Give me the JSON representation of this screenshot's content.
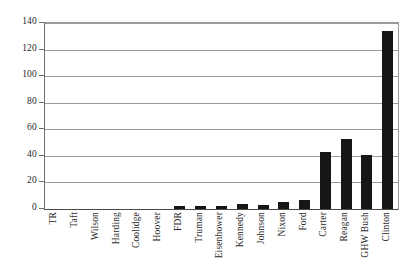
{
  "chart_data": {
    "type": "bar",
    "title": "",
    "subtitle": "",
    "xlabel": "",
    "ylabel": "",
    "ylim": [
      0,
      140
    ],
    "ytick_step": 20,
    "yticks": [
      0,
      20,
      40,
      60,
      80,
      100,
      120,
      140
    ],
    "ytick_labels": [
      "0",
      "20",
      "40",
      "60",
      "80",
      "100",
      "120",
      "140"
    ],
    "grid": "horizontal",
    "legend": "none",
    "bar_color": "#161616",
    "gridline_color": "#9b9b9b",
    "axis_color": "#4a4a4a",
    "categories": [
      "TR",
      "Taft",
      "Wilson",
      "Harding",
      "Coolidge",
      "Hoover",
      "FDR",
      "Truman",
      "Eisenhower",
      "Kennedy",
      "Johnson",
      "Nixon",
      "Ford",
      "Carter",
      "Reagan",
      "GHW Bush",
      "Clinton"
    ],
    "values": [
      0,
      0,
      0,
      0,
      0,
      0,
      2,
      2,
      2,
      4,
      3,
      5,
      7,
      43,
      53,
      41,
      134
    ]
  }
}
